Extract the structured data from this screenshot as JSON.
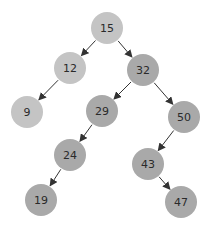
{
  "diagram": {
    "type": "binary-search-tree",
    "colors": {
      "light_node": "#c4c4c4",
      "dark_node": "#a9a9a9",
      "edge": "#333333",
      "label": "#2a2a2a",
      "background": "#ffffff"
    },
    "nodes": [
      {
        "id": "n15",
        "label": "15",
        "x": 107,
        "y": 28,
        "shade": "light"
      },
      {
        "id": "n12",
        "label": "12",
        "x": 70,
        "y": 68,
        "shade": "light"
      },
      {
        "id": "n32",
        "label": "32",
        "x": 143,
        "y": 70,
        "shade": "dark"
      },
      {
        "id": "n9",
        "label": "9",
        "x": 27,
        "y": 112,
        "shade": "light"
      },
      {
        "id": "n29",
        "label": "29",
        "x": 102,
        "y": 111,
        "shade": "dark"
      },
      {
        "id": "n50",
        "label": "50",
        "x": 184,
        "y": 117,
        "shade": "dark"
      },
      {
        "id": "n24",
        "label": "24",
        "x": 70,
        "y": 155,
        "shade": "dark"
      },
      {
        "id": "n43",
        "label": "43",
        "x": 148,
        "y": 164,
        "shade": "dark"
      },
      {
        "id": "n19",
        "label": "19",
        "x": 41,
        "y": 200,
        "shade": "dark"
      },
      {
        "id": "n47",
        "label": "47",
        "x": 181,
        "y": 202,
        "shade": "dark"
      }
    ],
    "edges": [
      {
        "from": "n15",
        "to": "n12"
      },
      {
        "from": "n15",
        "to": "n32"
      },
      {
        "from": "n12",
        "to": "n9"
      },
      {
        "from": "n32",
        "to": "n29"
      },
      {
        "from": "n32",
        "to": "n50"
      },
      {
        "from": "n29",
        "to": "n24"
      },
      {
        "from": "n24",
        "to": "n19"
      },
      {
        "from": "n50",
        "to": "n43"
      },
      {
        "from": "n43",
        "to": "n47"
      }
    ],
    "node_radius": 16
  }
}
